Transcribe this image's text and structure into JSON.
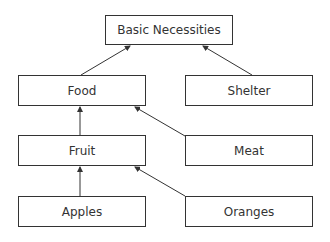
{
  "diagram": {
    "type": "hierarchy",
    "nodes": [
      {
        "id": "basic",
        "label": "Basic Necessities",
        "x": 105,
        "y": 15,
        "w": 128,
        "h": 30
      },
      {
        "id": "food",
        "label": "Food",
        "x": 18,
        "y": 75,
        "w": 128,
        "h": 31
      },
      {
        "id": "shelter",
        "label": "Shelter",
        "x": 185,
        "y": 75,
        "w": 128,
        "h": 31
      },
      {
        "id": "fruit",
        "label": "Fruit",
        "x": 18,
        "y": 135,
        "w": 128,
        "h": 31
      },
      {
        "id": "meat",
        "label": "Meat",
        "x": 185,
        "y": 135,
        "w": 128,
        "h": 31
      },
      {
        "id": "apples",
        "label": "Apples",
        "x": 18,
        "y": 196,
        "w": 128,
        "h": 31
      },
      {
        "id": "oranges",
        "label": "Oranges",
        "x": 185,
        "y": 196,
        "w": 128,
        "h": 31
      }
    ],
    "edges": [
      {
        "from": "food",
        "to": "basic"
      },
      {
        "from": "shelter",
        "to": "basic"
      },
      {
        "from": "fruit",
        "to": "food"
      },
      {
        "from": "meat",
        "to": "food"
      },
      {
        "from": "apples",
        "to": "fruit"
      },
      {
        "from": "oranges",
        "to": "fruit"
      }
    ],
    "colors": {
      "stroke": "#333333",
      "background": "#ffffff",
      "text": "#333333"
    }
  }
}
